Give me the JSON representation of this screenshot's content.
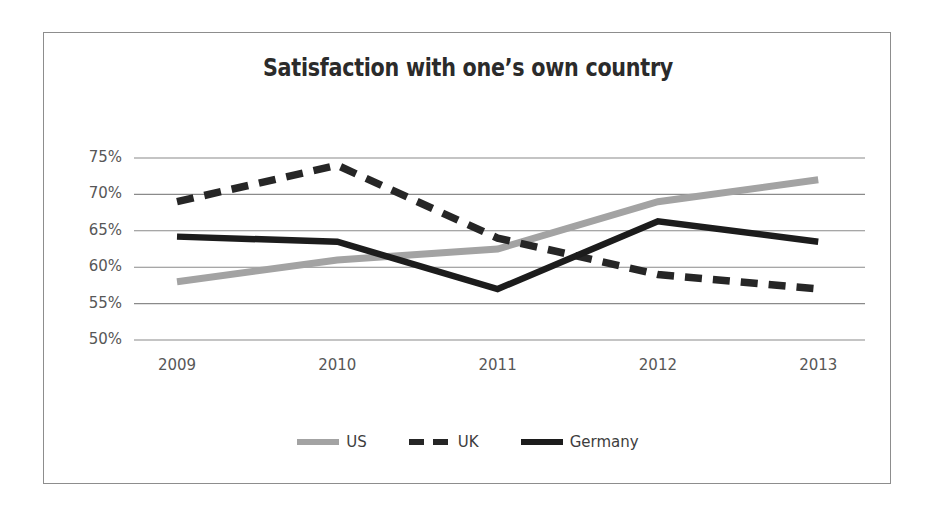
{
  "chart_data": {
    "type": "line",
    "title": "Satisfaction with one’s own country",
    "xlabel": "",
    "ylabel": "",
    "categories": [
      "2009",
      "2010",
      "2011",
      "2012",
      "2013"
    ],
    "x": [
      2009,
      2010,
      2011,
      2012,
      2013
    ],
    "ylim": [
      50,
      75
    ],
    "yticks": [
      50,
      55,
      60,
      65,
      70,
      75
    ],
    "ytick_labels": [
      "50%",
      "55%",
      "60%",
      "65%",
      "70%",
      "75%"
    ],
    "grid": "horizontal",
    "legend_position": "bottom",
    "series": [
      {
        "name": "US",
        "values": [
          58,
          61,
          62.5,
          69,
          72
        ],
        "color": "#a3a3a3",
        "style": "solid",
        "swatch_icon": "solid-line-swatch"
      },
      {
        "name": "UK",
        "values": [
          69,
          74,
          64,
          59,
          57
        ],
        "color": "#262626",
        "style": "dashed",
        "swatch_icon": "dashed-line-swatch"
      },
      {
        "name": "Germany",
        "values": [
          64.2,
          63.5,
          57,
          66.3,
          63.5
        ],
        "color": "#1c1c1c",
        "style": "solid",
        "swatch_icon": "solid-line-swatch"
      }
    ]
  },
  "colors": {
    "frame_border": "#8d8d8d",
    "gridline": "#8a8a8a",
    "tick_text": "#575757",
    "title_text": "#2b2b2b",
    "background": "#ffffff"
  }
}
